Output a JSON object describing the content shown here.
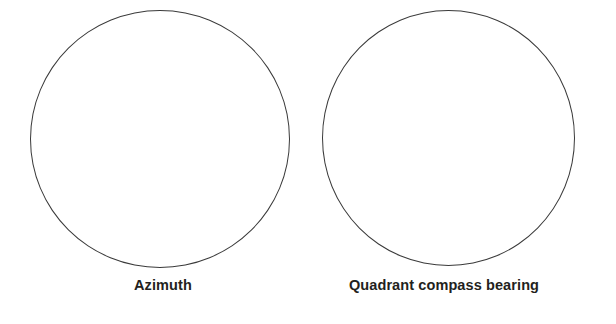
{
  "figure": {
    "background_color": "#ffffff",
    "stroke_color": "#3a3a3a",
    "label_color": "#231f20",
    "panels": [
      {
        "id": "azimuth",
        "shape": "circle",
        "shape_name": "compass-dial-outline",
        "caption": "Azimuth",
        "interior_marks": ""
      },
      {
        "id": "quadrant",
        "shape": "circle",
        "shape_name": "compass-dial-outline",
        "caption": "Quadrant compass bearing",
        "interior_marks": ""
      }
    ]
  }
}
